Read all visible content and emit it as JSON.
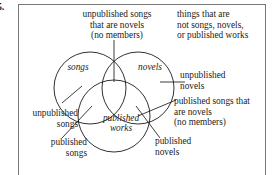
{
  "item": {
    "number": "5."
  },
  "figure": {
    "type": "venn-diagram",
    "sets": [
      {
        "id": "songs",
        "label": "songs"
      },
      {
        "id": "novels",
        "label": "novels"
      },
      {
        "id": "published-works",
        "label": "published\nworks"
      }
    ],
    "region_labels": [
      {
        "id": "unpublished-songs-that-are-novels",
        "text": "unpublished songs\nthat are novels\n(no members)",
        "align": "center"
      },
      {
        "id": "things-not-songs-novels-or-published-works",
        "text": "things that are\nnot songs, novels,\nor published works",
        "align": "left"
      },
      {
        "id": "unpublished-novels",
        "text": "unpublished\nnovels",
        "align": "left"
      },
      {
        "id": "published-songs-that-are-novels",
        "text": "published songs that\nare novels\n(no members)",
        "align": "left"
      },
      {
        "id": "unpublished-songs",
        "text": "unpublished\nsongs",
        "align": "right"
      },
      {
        "id": "published-songs",
        "text": "published\nsongs",
        "align": "right"
      },
      {
        "id": "published-novels",
        "text": "published\nnovels",
        "align": "left"
      }
    ],
    "colors": {
      "stroke": "#1b1b1b",
      "border": "#777777",
      "text": "#1b1b1b",
      "background": "#ffffff"
    }
  }
}
